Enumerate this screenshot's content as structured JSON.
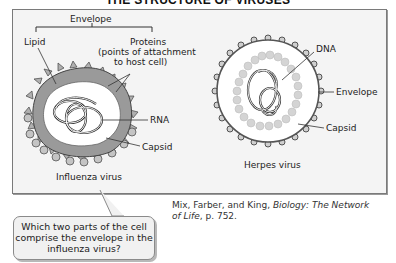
{
  "title": "THE STRUCTURE OF VIRUSES",
  "influenza": {
    "envelope_label": "Envelope",
    "lipid_label": "Lipid",
    "proteins_label_line1": "Proteins",
    "proteins_label_line2": "(points of attachment",
    "proteins_label_line3": "to host cell)",
    "rna_label": "RNA",
    "capsid_label": "Capsid",
    "caption": "Influenza virus"
  },
  "herpes": {
    "dna_label": "DNA",
    "envelope_label": "Envelope",
    "capsid_label": "Capsid",
    "caption": "Herpes virus"
  },
  "citation": {
    "authors": "Mix, Farber, and King, ",
    "work_title_part1": "Biology: The Network",
    "work_title_part2": "of Life",
    "page": ", p. 752."
  },
  "callout": {
    "question": "Which two parts of the cell comprise the envelope in the influenza virus?"
  },
  "colors": {
    "frame_bg": "#f4f4f4",
    "lipid_gray": "#9a9a9a",
    "protein_spike": "#b0b0b0",
    "capsid_bead": "#d4d4d4"
  }
}
